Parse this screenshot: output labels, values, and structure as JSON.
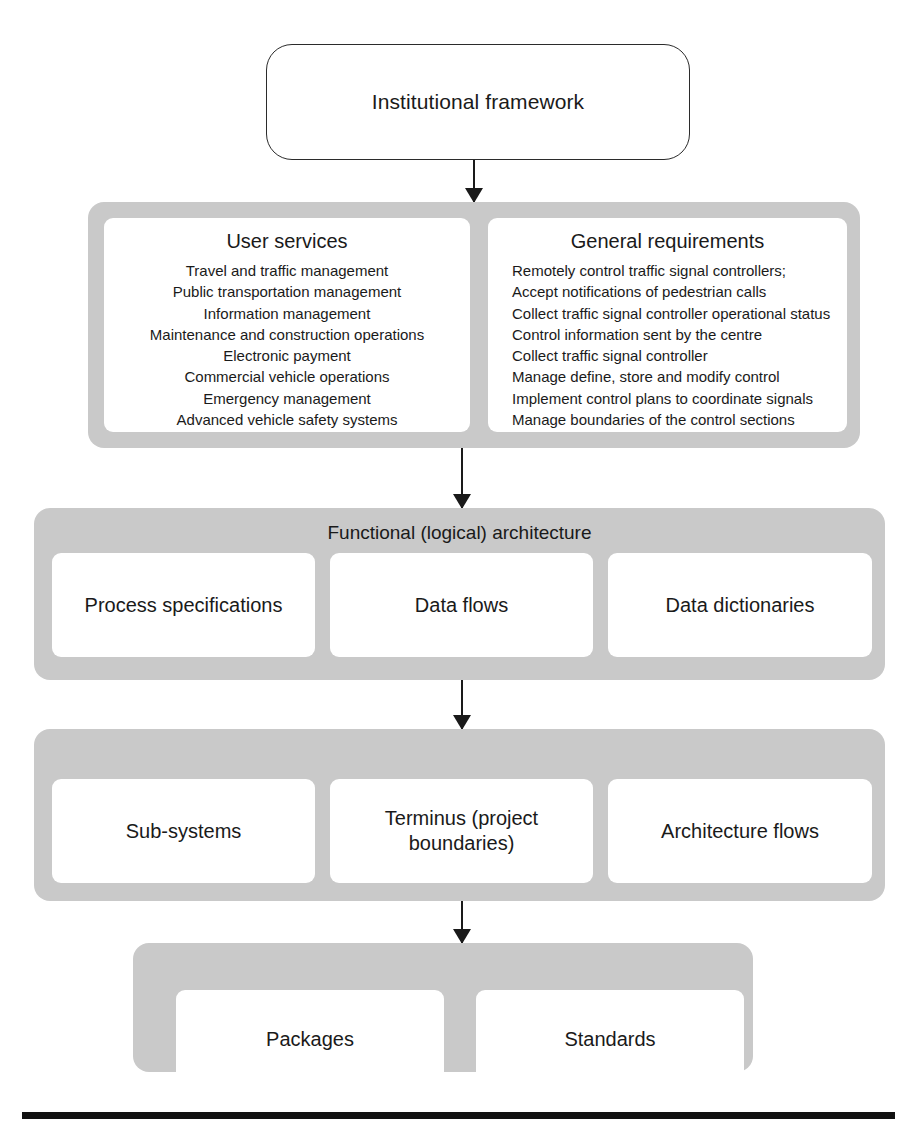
{
  "diagram": {
    "colors": {
      "band_gray": "#c9c9c9",
      "panel_white": "#ffffff",
      "ink": "#1a1a1a",
      "rule_black": "#111111"
    },
    "top_node": {
      "label": "Institutional framework"
    },
    "layers": [
      {
        "id": "requirements",
        "title": "",
        "panels": [
          {
            "id": "user-services",
            "heading": "User services",
            "align": "centered",
            "items": [
              "Travel and traffic management",
              "Public transportation management",
              "Information management",
              "Maintenance and construction operations",
              "Electronic payment",
              "Commercial vehicle operations",
              "Emergency management",
              "Advanced vehicle safety systems"
            ]
          },
          {
            "id": "general-requirements",
            "heading": "General requirements",
            "align": "left",
            "items": [
              "Remotely control traffic signal controllers;",
              "Accept notifications of pedestrian calls",
              "Collect traffic signal controller operational status",
              "Control information sent by the centre",
              "Collect traffic signal controller",
              "Manage define, store and modify control",
              "Implement control plans to coordinate signals",
              "Manage boundaries of the control sections"
            ]
          }
        ]
      },
      {
        "id": "functional-architecture",
        "title": "Functional (logical) architecture",
        "panels": [
          {
            "id": "process-specifications",
            "label": "Process specifications"
          },
          {
            "id": "data-flows",
            "label": "Data flows"
          },
          {
            "id": "data-dictionaries",
            "label": "Data dictionaries"
          }
        ]
      },
      {
        "id": "physical-architecture",
        "title": "",
        "panels": [
          {
            "id": "sub-systems",
            "label": "Sub-systems"
          },
          {
            "id": "terminus",
            "label": "Terminus (project boundaries)"
          },
          {
            "id": "architecture-flows",
            "label": "Architecture flows"
          }
        ]
      },
      {
        "id": "deployment",
        "title": "",
        "panels": [
          {
            "id": "packages",
            "label": "Packages"
          },
          {
            "id": "standards",
            "label": "Standards"
          }
        ]
      }
    ],
    "connectors": [
      {
        "id": "framework-to-requirements",
        "from": "top_node",
        "to": "requirements"
      },
      {
        "id": "requirements-to-functional",
        "from": "requirements",
        "to": "functional-architecture"
      },
      {
        "id": "functional-to-physical",
        "from": "functional-architecture",
        "to": "physical-architecture"
      },
      {
        "id": "physical-to-deployment",
        "from": "physical-architecture",
        "to": "deployment"
      }
    ]
  }
}
